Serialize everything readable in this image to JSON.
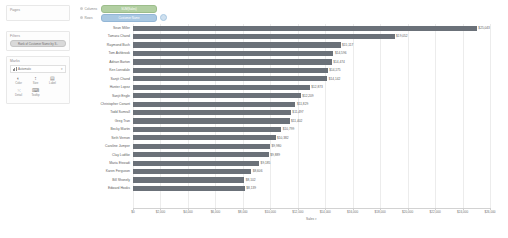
{
  "sidebar": {
    "pages": {
      "title": "Pages"
    },
    "filters": {
      "title": "Filters",
      "pills": [
        {
          "label": "Rank of Customer Name by S..",
          "type": "filter"
        }
      ]
    },
    "marks": {
      "title": "Marks",
      "type_selected": "Automatic",
      "chevron": "▾",
      "buttons": [
        {
          "label": "Color",
          "icon": "color-icon",
          "glyph": "◐"
        },
        {
          "label": "Size",
          "icon": "size-icon",
          "glyph": "↕"
        },
        {
          "label": "Label",
          "icon": "label-icon",
          "glyph": "▤"
        },
        {
          "label": "Detail",
          "icon": "detail-icon",
          "glyph": "⁙"
        },
        {
          "label": "Tooltip",
          "icon": "tooltip-icon",
          "glyph": "⌨"
        }
      ]
    }
  },
  "shelves": {
    "columns": {
      "label": "Columns",
      "pill": "SUM(Sales)",
      "pill_type": "green"
    },
    "rows": {
      "label": "Rows",
      "pill": "Customer Name",
      "pill_type": "blue",
      "has_sort": true
    }
  },
  "colors": {
    "bar": "#6b7179",
    "grid": "#ececec",
    "axis": "#d2d2d2",
    "text": "#5d5d5d",
    "pill_green": "#b2cfa2",
    "pill_blue": "#a9c8e2"
  },
  "chart_data": {
    "type": "bar",
    "orientation": "horizontal",
    "title": "",
    "xlabel": "Sales",
    "ylabel": "Customer Name",
    "xlim": [
      0,
      26000
    ],
    "grid": true,
    "legend": false,
    "xticks": [
      0,
      2000,
      4000,
      6000,
      8000,
      10000,
      12000,
      14000,
      16000,
      18000,
      20000,
      22000,
      24000,
      26000
    ],
    "xticklabels": [
      "$0",
      "$2,000",
      "$4,000",
      "$6,000",
      "$8,000",
      "$10,000",
      "$12,000",
      "$14,000",
      "$16,000",
      "$18,000",
      "$20,000",
      "$22,000",
      "$24,000",
      "$26,000"
    ],
    "categories": [
      "Sean Miller",
      "Tamara Chand",
      "Raymond Buch",
      "Tom Ashbrook",
      "Adrian Barton",
      "Ken Lonsdale",
      "Sanjit Chand",
      "Hunter Lopez",
      "Sanjit Engle",
      "Christopher Conant",
      "Todd Sumrall",
      "Greg Tran",
      "Becky Martin",
      "Seth Vernon",
      "Caroline Jumper",
      "Clay Ludtke",
      "Maria Etezadi",
      "Karen Ferguson",
      "Bill Shonely",
      "Edward Hooks"
    ],
    "values": [
      25043,
      19052,
      15117,
      14596,
      14474,
      14175,
      14142,
      12873,
      12209,
      11829,
      11497,
      11402,
      10799,
      10382,
      9980,
      9889,
      9185,
      8606,
      8102,
      8139
    ],
    "value_labels": [
      "$25,043",
      "$19,052",
      "$15,117",
      "$14,596",
      "$14,474",
      "$14,175",
      "$14,142",
      "$12,873",
      "$12,209",
      "$11,829",
      "$11,497",
      "$11,402",
      "$10,799",
      "$10,382",
      "$9,980",
      "$9,889",
      "$9,185",
      "$8,606",
      "$8,102",
      "$8,139"
    ],
    "axis_title_sort": "▾"
  }
}
